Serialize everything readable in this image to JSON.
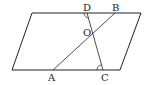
{
  "diagram": {
    "type": "geometry",
    "shape": "parallelogram",
    "points": {
      "A": {
        "label": "A",
        "x": 53,
        "y": 70
      },
      "B": {
        "label": "B",
        "x": 115,
        "y": 13
      },
      "C": {
        "label": "C",
        "x": 103,
        "y": 70
      },
      "D": {
        "label": "D",
        "x": 87,
        "y": 13
      },
      "O": {
        "label": "O",
        "x": 92,
        "y": 33
      }
    },
    "parallelogram_vertices": [
      [
        32,
        13
      ],
      [
        141,
        13
      ],
      [
        120,
        70
      ],
      [
        12,
        70
      ]
    ],
    "segments": [
      [
        "A",
        "B"
      ],
      [
        "D",
        "C"
      ]
    ],
    "angle_marks": [
      "D",
      "C"
    ],
    "colors": {
      "stroke": "#222222",
      "background": "#ffffff"
    }
  }
}
